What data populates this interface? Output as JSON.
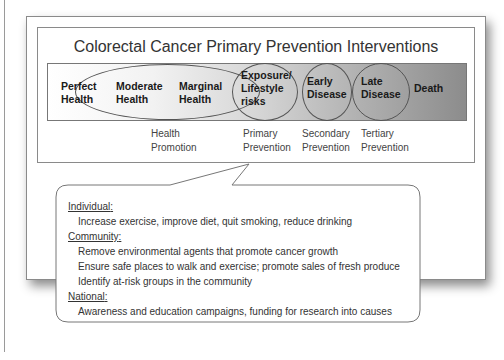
{
  "title": "Colorectal Cancer Primary Prevention Interventions",
  "stages": [
    {
      "line1": "Perfect",
      "line2": "Health"
    },
    {
      "line1": "Moderate",
      "line2": "Health"
    },
    {
      "line1": "Marginal",
      "line2": "Health"
    },
    {
      "line1": "Exposure/",
      "line2": "Lifestyle",
      "line3": "risks"
    },
    {
      "line1": "Early",
      "line2": "Disease"
    },
    {
      "line1": "Late",
      "line2": "Disease"
    },
    {
      "line1": "Death"
    }
  ],
  "prevention_labels": [
    {
      "line1": "Health",
      "line2": "Promotion"
    },
    {
      "line1": "Primary",
      "line2": "Prevention"
    },
    {
      "line1": "Secondary",
      "line2": "Prevention"
    },
    {
      "line1": "Tertiary",
      "line2": "Prevention"
    }
  ],
  "callout": {
    "sections": [
      {
        "heading": "Individual",
        "items": [
          "Increase exercise, improve diet, quit smoking, reduce drinking"
        ]
      },
      {
        "heading": "Community",
        "items": [
          "Remove environmental agents that promote cancer growth",
          "Ensure safe places to walk and exercise; promote sales of fresh produce",
          "Identify at-risk groups in the community"
        ]
      },
      {
        "heading": "National",
        "items": [
          "Awareness and education campaigns, funding for research into causes"
        ]
      }
    ]
  },
  "colors": {
    "band_start": "#ffffff",
    "band_end": "#8c8c8c",
    "border": "#8a8a8a"
  }
}
